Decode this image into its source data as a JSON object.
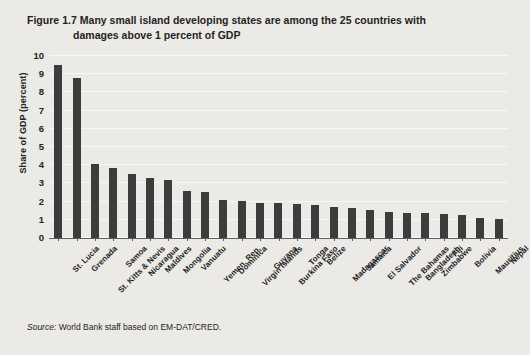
{
  "figure": {
    "number": "Figure 1.7",
    "title_line1": "Many small island developing states are among the 25 countries with",
    "title_line2": "damages above 1 percent of GDP"
  },
  "source": {
    "label": "Source:",
    "text": "World Bank staff based on EM-DAT/CRED."
  },
  "colors": {
    "bar": "#3c3c3c",
    "background": "#eceae6",
    "gridline": "#f8f7f5",
    "axis": "#5d5d5d",
    "text": "#232323"
  },
  "chart_data": {
    "type": "bar",
    "title": "Many small island developing states are among the 25 countries with damages above 1 percent of GDP",
    "xlabel": "",
    "ylabel": "Share of GDP (percent)",
    "ylim": [
      0,
      10
    ],
    "yticks": [
      0,
      1,
      2,
      3,
      4,
      5,
      6,
      7,
      8,
      9,
      10
    ],
    "grid": true,
    "legend": "none",
    "orientation": "vertical",
    "categories": [
      "St. Lucia",
      "Grenada",
      "St. Kitts & Nevis",
      "Samoa",
      "Nicaragua",
      "Maldives",
      "Mongolia",
      "Vanuatu",
      "Yemen, Rep.",
      "Dominica",
      "Virgin Islands",
      "Guyana",
      "Burkina Faso",
      "Tonga",
      "Belize",
      "Madagascar",
      "Jamaica",
      "El Salvador",
      "The Bahamas",
      "Bangladesh",
      "Zimbabwe",
      "Fiji",
      "Bolivia",
      "Mauritius",
      "Nepal"
    ],
    "values": [
      9.5,
      8.8,
      4.05,
      3.85,
      3.5,
      3.3,
      3.2,
      2.6,
      2.55,
      2.1,
      2.05,
      1.95,
      1.9,
      1.85,
      1.8,
      1.7,
      1.65,
      1.55,
      1.45,
      1.4,
      1.35,
      1.3,
      1.25,
      1.1,
      1.05
    ]
  }
}
